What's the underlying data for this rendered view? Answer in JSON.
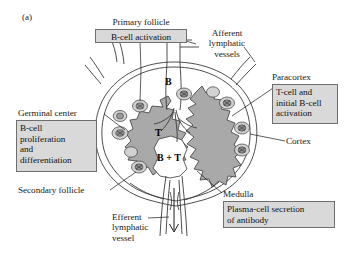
{
  "figure": {
    "panel_tag": "(a)"
  },
  "colors": {
    "paracortex_fill": "#a9a9a9",
    "callout_fill": "#d9d9d9",
    "callout_border": "#6e6e6e",
    "outline": "#3a3a3a",
    "follicle_fill": "#d2d2d2",
    "germinal_fill": "#9a9a9a",
    "text": "#1a1a1a"
  },
  "labels": {
    "primary_follicle": "Primary follicle",
    "afferent_vessels": "Afferent\nlymphatic\nvessels",
    "paracortex": "Paracortex",
    "germinal_center": "Germinal center",
    "cortex": "Cortex",
    "secondary_follicle": "Secondary follicle",
    "efferent_vessel": "Efferent\nlymphatic\nvessel",
    "medulla": "Medulla"
  },
  "callouts": {
    "b_cell_activation": "B-cell activation",
    "t_and_b_activation": "T-cell and\ninitial B-cell\nactivation",
    "b_cell_proliferation": "B-cell\nproliferation\nand\ndifferentiation",
    "plasma_cell_secretion": "Plasma-cell secretion\nof antibody"
  },
  "zones": {
    "b_zone": "B",
    "t_zone": "T",
    "b_plus_t_zone": "B + T"
  }
}
